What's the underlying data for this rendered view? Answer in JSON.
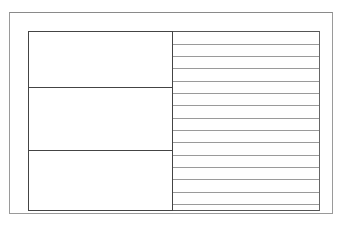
{
  "diagram": {
    "type": "layout-grid",
    "outer_frame": {
      "x": 9,
      "y": 12,
      "w": 324,
      "h": 202,
      "color": "#9a9a9a"
    },
    "inner_frame": {
      "x": 28,
      "y": 31,
      "w": 292,
      "h": 180,
      "color": "#555555"
    },
    "left_column": {
      "x": 28,
      "w": 145,
      "cells": [
        {
          "top": 0,
          "height": 56
        },
        {
          "top": 56,
          "height": 63
        },
        {
          "top": 119,
          "height": 61
        }
      ]
    },
    "right_column": {
      "x": 173,
      "w": 147,
      "line_offsets": [
        12,
        24,
        36,
        49,
        61,
        73,
        86,
        98,
        110,
        123,
        135,
        147,
        160,
        172
      ],
      "line_color": "#9a9a9a"
    }
  }
}
